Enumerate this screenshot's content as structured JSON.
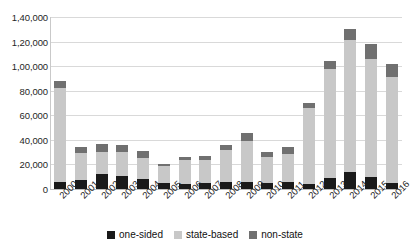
{
  "chart_data": {
    "type": "bar",
    "stacked": true,
    "title": "",
    "subtitle": "",
    "xlabel": "",
    "ylabel": "",
    "categories": [
      "2000",
      "2001",
      "2002",
      "2003",
      "2004",
      "2005",
      "2006",
      "2007",
      "2008",
      "2009",
      "2010",
      "2011",
      "2012",
      "2013",
      "2014",
      "2015",
      "2016"
    ],
    "series": [
      {
        "name": "one-sided",
        "color": "#1a1a1a",
        "values": [
          6000,
          7000,
          12000,
          11000,
          8000,
          4500,
          4000,
          5000,
          5500,
          6000,
          5000,
          5500,
          4000,
          9000,
          14000,
          10000,
          5000
        ]
      },
      {
        "name": "state-based",
        "color": "#c8c8c8",
        "values": [
          76000,
          22000,
          18500,
          19500,
          17000,
          14000,
          19500,
          18500,
          26000,
          33000,
          21000,
          23000,
          62000,
          89000,
          1070000,
          96000,
          86000
        ]
      },
      {
        "name": "non-state",
        "color": "#707070",
        "values": [
          6000,
          5000,
          6000,
          5000,
          6000,
          1500,
          2500,
          3000,
          4500,
          7000,
          4000,
          5500,
          4000,
          6000,
          9000,
          12000,
          11000
        ]
      }
    ],
    "totals": [
      88000,
      34000,
      36500,
      35500,
      31000,
      20000,
      26000,
      26500,
      36000,
      46000,
      30000,
      34000,
      70000,
      104000,
      130000,
      118000,
      102000
    ],
    "ylim": [
      0,
      140000
    ],
    "ytick_step": 20000,
    "ytick_labels": [
      "1,40,000",
      "1,20,000",
      "1,00,000",
      "80,000",
      "60,000",
      "40,000",
      "20,000",
      "0"
    ],
    "ytick_values": [
      140000,
      120000,
      100000,
      80000,
      60000,
      40000,
      20000,
      0
    ],
    "grid": true,
    "legend_position": "bottom",
    "number_format": "indian"
  },
  "legend": {
    "items": [
      {
        "label": "one-sided",
        "color": "#1a1a1a"
      },
      {
        "label": "state-based",
        "color": "#c8c8c8"
      },
      {
        "label": "non-state",
        "color": "#707070"
      }
    ]
  }
}
